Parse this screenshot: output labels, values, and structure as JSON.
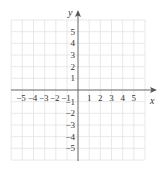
{
  "figure": {
    "type": "coordinate-grid",
    "x_axis_label": "x",
    "y_axis_label": "y",
    "x_ticks": [
      "−5",
      "−4",
      "−3",
      "−2",
      "−1",
      "1",
      "2",
      "3",
      "4",
      "5"
    ],
    "y_ticks_positive": [
      "5",
      "4",
      "3",
      "2",
      "1"
    ],
    "y_ticks_negative": [
      "−1",
      "−2",
      "−3",
      "−4",
      "−5"
    ],
    "grid_range": [
      -6,
      6
    ],
    "colors": {
      "grid": "#e2e2e2",
      "axis": "#555555",
      "text": "#333333"
    }
  }
}
